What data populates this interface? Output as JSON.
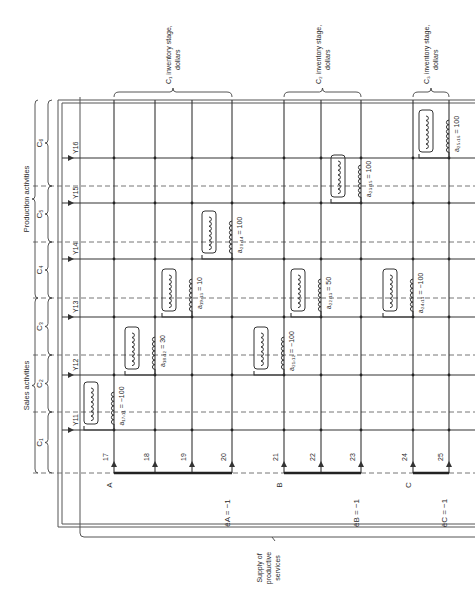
{
  "diagram": {
    "orientation": "rotated-90-ccw",
    "column_groups": [
      {
        "label": "C₁ inventory stage, dollars",
        "x1": 114,
        "x2": 232
      },
      {
        "label": "C₂ inventory stage, dollars",
        "x1": 284,
        "x2": 361
      },
      {
        "label": "C₃ inventory stage, dollars",
        "x1": 413,
        "x2": 449
      }
    ],
    "row_groups": [
      {
        "label": "Sales activities",
        "y1": 298,
        "y2": 473
      },
      {
        "label": "Production activities",
        "y1": 100,
        "y2": 298
      }
    ],
    "row_subgroups": [
      {
        "label": "C₁",
        "y1": 412,
        "y2": 473
      },
      {
        "label": "C₂",
        "y1": 355,
        "y2": 412
      },
      {
        "label": "C₃",
        "y1": 298,
        "y2": 355
      },
      {
        "label": "C₄",
        "y1": 242,
        "y2": 298
      },
      {
        "label": "C₅",
        "y1": 186,
        "y2": 242
      },
      {
        "label": "C₆",
        "y1": 100,
        "y2": 186
      }
    ],
    "rows": [
      {
        "id": "11",
        "y": 430
      },
      {
        "id": "12",
        "y": 375
      },
      {
        "id": "13",
        "y": 317
      },
      {
        "id": "14",
        "y": 259
      },
      {
        "id": "15",
        "y": 203
      },
      {
        "id": "16",
        "y": 158
      }
    ],
    "columns": [
      {
        "id": "17",
        "x": 114,
        "bus": "A"
      },
      {
        "id": "18",
        "x": 155,
        "bus": ""
      },
      {
        "id": "19",
        "x": 192,
        "bus": ""
      },
      {
        "id": "20",
        "x": 232,
        "bus": ""
      },
      {
        "id": "21",
        "x": 284,
        "bus": "B"
      },
      {
        "id": "22",
        "x": 321,
        "bus": ""
      },
      {
        "id": "23",
        "x": 361,
        "bus": ""
      },
      {
        "id": "24",
        "x": 413,
        "bus": "C"
      },
      {
        "id": "25",
        "x": 449,
        "bus": ""
      }
    ],
    "buses": [
      {
        "label": "A",
        "x1": 114,
        "x2": 232,
        "potential": "êA = −1",
        "px": 232
      },
      {
        "label": "B",
        "x1": 284,
        "x2": 361,
        "potential": "êB = −1",
        "px": 361
      },
      {
        "label": "C",
        "x1": 413,
        "x2": 449,
        "potential": "êC = −1",
        "px": 449
      }
    ],
    "couplings": [
      {
        "name": "a17,11",
        "text": "a₁₇,₁₁ = −100",
        "col": 114,
        "row": 430
      },
      {
        "name": "a18,12",
        "text": "a₁₈,₁₂ = 30",
        "col": 155,
        "row": 375
      },
      {
        "name": "a19,13",
        "text": "a₁₉,₁₃ = 10",
        "col": 192,
        "row": 317
      },
      {
        "name": "a20,14",
        "text": "a₂₀,₁₄ = 100",
        "col": 232,
        "row": 259
      },
      {
        "name": "a21,12",
        "text": "a₂₁,₁₂ = −100",
        "col": 284,
        "row": 375
      },
      {
        "name": "a22,13",
        "text": "a₂₂,₁₃ = 50",
        "col": 321,
        "row": 317
      },
      {
        "name": "a23,15",
        "text": "a₂₃,₁₅ = 100",
        "col": 361,
        "row": 203
      },
      {
        "name": "a24,13",
        "text": "a₂₄,₁₃ = −100",
        "col": 413,
        "row": 317
      },
      {
        "name": "a25,16",
        "text": "a₂₅,₁₆ = 100",
        "col": 449,
        "row": 158
      }
    ],
    "supply_label": "Supply of productive services",
    "inventory_word": "inventory stage,",
    "dollars_word": "dollars"
  }
}
